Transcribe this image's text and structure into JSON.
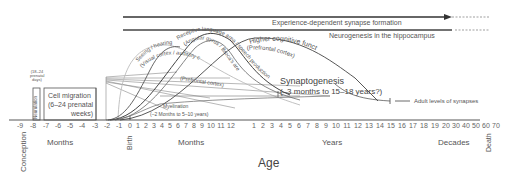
{
  "axis": {
    "label": "Age",
    "prenatal_ticks": [
      "-9",
      "-8",
      "-7",
      "-6",
      "-5",
      "-4",
      "-3",
      "-2",
      "-1",
      "0"
    ],
    "months_ticks": [
      "1",
      "2",
      "3",
      "4",
      "5",
      "6",
      "7",
      "8",
      "9",
      "10",
      "11",
      "12"
    ],
    "years_ticks": [
      "1",
      "2",
      "3",
      "4",
      "5",
      "6",
      "7",
      "8",
      "9",
      "10",
      "11",
      "12",
      "13",
      "14",
      "15",
      "16",
      "17",
      "18",
      "19",
      "20"
    ],
    "decades_ticks": [
      "30",
      "40",
      "50",
      "60",
      "70"
    ],
    "unit_labels": {
      "prenatal": "Months",
      "postnatal_months": "Months",
      "years": "Years",
      "decades": "Decades"
    },
    "markers": {
      "conception": "Conception",
      "birth": "Birth",
      "death": "Death"
    }
  },
  "bars": {
    "experience": "Experience-dependent synapse formation",
    "neurogenesis": "Neurogenesis in the hippocampus"
  },
  "prenatal": {
    "neurulation": "Neurulation",
    "neurulation_timing": [
      "(18–24",
      "prenatal",
      "days)"
    ],
    "cell_migration": [
      "Cell migration",
      "(6–24 prenatal",
      "weeks)"
    ]
  },
  "curves": {
    "seeing_hearing": "Seeing / hearing",
    "visual_auditory": "(Visual cortex / auditory cortex)",
    "receptive_language": "Receptive language area / speech production",
    "angular_broca": "(Angular gyrus / Broca's area)",
    "higher_cognitive": "Higher cognitive functions",
    "prefrontal_curve": "(Prefrontal cortex)",
    "prefrontal_line": "(Prefrontal cortex)"
  },
  "annotations": {
    "synaptogenesis": "Synaptogenesis",
    "synaptogenesis_range": "(–3 months to 15–18 years?)",
    "myelination": "Myelination",
    "myelination_range": "(–2 Months to 5–10 years)",
    "adult_levels": "Adult levels of synapses"
  },
  "colors": {
    "dark_line": "#333333",
    "mid_line": "#666666",
    "light_line": "#bbbbbb",
    "text": "#555555"
  }
}
